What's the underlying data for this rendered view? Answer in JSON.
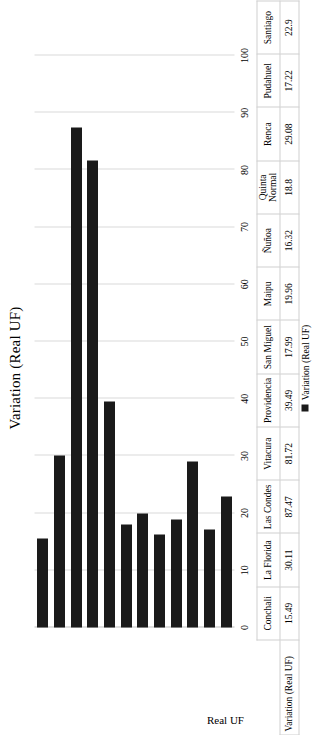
{
  "chart_data": {
    "type": "bar",
    "orientation": "vertical",
    "title": "Variation (Real UF)",
    "xlabel": "",
    "ylabel": "Real UF",
    "ylim": [
      0,
      100
    ],
    "ytick_labels": [
      "0",
      "10",
      "20",
      "30",
      "40",
      "50",
      "60",
      "70",
      "80",
      "90",
      "100"
    ],
    "ytick_values": [
      0,
      10,
      20,
      30,
      40,
      50,
      60,
      70,
      80,
      90,
      100
    ],
    "grid": true,
    "legend_position": "bottom",
    "legend": [
      "Variation (Real UF)"
    ],
    "series_name": "Variation (Real UF)",
    "series_color": "#1a1a1a",
    "categories": [
      "Conchali",
      "La Florida",
      "Las Condes",
      "Vitacura",
      "Providencia",
      "San Miguel",
      "Maipu",
      "Ñuñoa",
      "Quinta Normal",
      "Renca",
      "Pudahuel",
      "Santiago"
    ],
    "values": [
      15.49,
      30.11,
      87.47,
      81.72,
      39.49,
      17.99,
      19.96,
      16.32,
      18.8,
      29.08,
      17.22,
      22.9
    ],
    "value_labels": [
      "15.49",
      "30.11",
      "87.47",
      "81.72",
      "39.49",
      "17.99",
      "19.96",
      "16.32",
      "18.8",
      "29.08",
      "17.22",
      "22.9"
    ],
    "data_table_row_header": "Variation (Real UF)"
  },
  "figure": {
    "title": "Variation (Real UF)",
    "axis_label": "Real UF",
    "legend_label": "Variation (Real UF)",
    "table_row_header": "Variation (Real UF)"
  }
}
